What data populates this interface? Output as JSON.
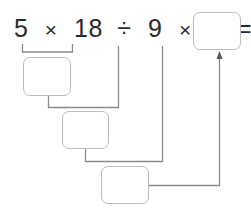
{
  "expression": {
    "tokens": [
      "5",
      "×",
      "18",
      "÷",
      "9",
      "×",
      "4",
      "="
    ]
  },
  "answer_boxes": [
    {
      "id": "result",
      "value": ""
    },
    {
      "id": "step1",
      "value": ""
    },
    {
      "id": "step2",
      "value": ""
    },
    {
      "id": "step3",
      "value": ""
    }
  ],
  "colors": {
    "line": "#8a8a8a",
    "box_border": "#bdbdbd",
    "text": "#2a2a2a"
  }
}
